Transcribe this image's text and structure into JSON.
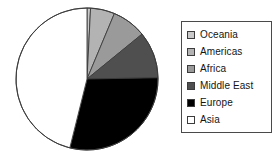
{
  "chart_data": {
    "type": "pie",
    "title": "",
    "labels": [
      "Oceania",
      "Americas",
      "Africa",
      "Middle East",
      "Europe",
      "Asia"
    ],
    "values": [
      0.8,
      5.5,
      7.8,
      10.6,
      29.2,
      46.1
    ],
    "units": "percent",
    "start_angle_deg": 0,
    "direction": "clockwise",
    "legend_position": "right",
    "grid": false,
    "slice_colors": [
      "#c9c9c9",
      "#b3b3b3",
      "#9a9a9a",
      "#4f4f4f",
      "#000000",
      "#ffffff"
    ],
    "slice_edge_color": "#3c3c3c",
    "slices": [
      {
        "label": "Oceania",
        "value": 0.8,
        "color": "#c9c9c9",
        "start_deg": 0,
        "end_deg": 2.9
      },
      {
        "label": "Americas",
        "value": 5.5,
        "color": "#b3b3b3",
        "start_deg": 2.9,
        "end_deg": 22.7
      },
      {
        "label": "Africa",
        "value": 7.8,
        "color": "#9a9a9a",
        "start_deg": 22.7,
        "end_deg": 50.8
      },
      {
        "label": "Middle East",
        "value": 10.6,
        "color": "#4f4f4f",
        "start_deg": 50.8,
        "end_deg": 89.0
      },
      {
        "label": "Europe",
        "value": 29.2,
        "color": "#000000",
        "start_deg": 89.0,
        "end_deg": 194.0
      },
      {
        "label": "Asia",
        "value": 46.1,
        "color": "#ffffff",
        "start_deg": 194.0,
        "end_deg": 360.0
      }
    ]
  },
  "legend": {
    "items": [
      {
        "label": "Oceania",
        "swatch": "#c9c9c9"
      },
      {
        "label": "Americas",
        "swatch": "#b3b3b3"
      },
      {
        "label": "Africa",
        "swatch": "#9a9a9a"
      },
      {
        "label": "Middle East",
        "swatch": "#4f4f4f"
      },
      {
        "label": "Europe",
        "swatch": "#000000"
      },
      {
        "label": "Asia",
        "swatch": "#ffffff"
      }
    ]
  }
}
